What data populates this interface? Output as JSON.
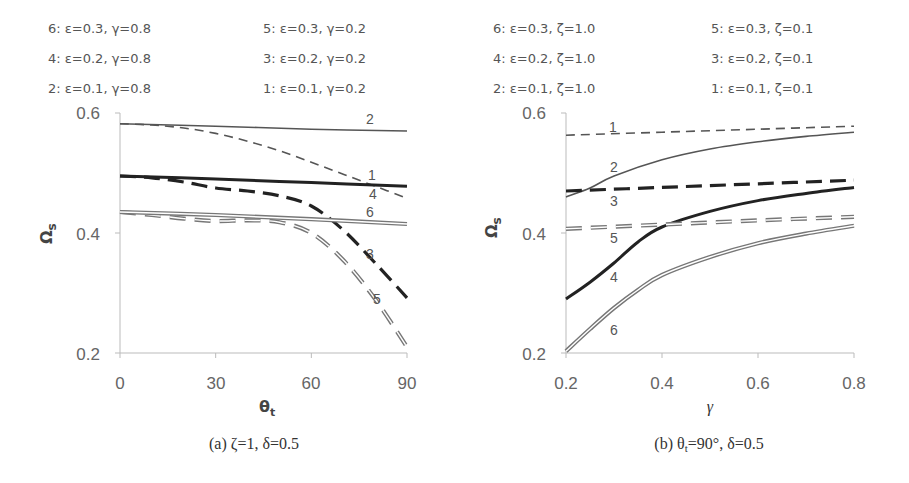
{
  "chart_data": [
    {
      "type": "line",
      "caption": "(a) ζ=1, δ=0.5",
      "xlabel": "θt",
      "ylabel": "Ωs",
      "xlim": [
        0,
        90
      ],
      "ylim": [
        0.2,
        0.6
      ],
      "xticks": [
        "0",
        "30",
        "60",
        "90"
      ],
      "yticks": [
        "0.2",
        "0.4",
        "0.6"
      ],
      "legend": [
        "6: ε=0.3, γ=0.8",
        "5: ε=0.3, γ=0.2",
        "4: ε=0.2, γ=0.8",
        "3: ε=0.2, γ=0.2",
        "2: ε=0.1, γ=0.8",
        "1: ε=0.1, γ=0.2"
      ],
      "series": [
        {
          "name": "1",
          "style": "thin-dash",
          "x": [
            0,
            10,
            20,
            30,
            40,
            50,
            60,
            70,
            80,
            90
          ],
          "y": [
            0.582,
            0.58,
            0.575,
            0.566,
            0.553,
            0.537,
            0.518,
            0.498,
            0.478,
            0.458
          ]
        },
        {
          "name": "2",
          "style": "thin-solid",
          "x": [
            0,
            30,
            60,
            90
          ],
          "y": [
            0.582,
            0.578,
            0.573,
            0.57
          ]
        },
        {
          "name": "3",
          "style": "thick-dash",
          "x": [
            0,
            10,
            20,
            30,
            40,
            50,
            60,
            70,
            80,
            90
          ],
          "y": [
            0.495,
            0.492,
            0.485,
            0.475,
            0.47,
            0.462,
            0.445,
            0.405,
            0.35,
            0.292
          ]
        },
        {
          "name": "4",
          "style": "thick-solid",
          "x": [
            0,
            30,
            60,
            90
          ],
          "y": [
            0.495,
            0.49,
            0.484,
            0.478
          ]
        },
        {
          "name": "5",
          "style": "double-dash",
          "x": [
            0,
            10,
            20,
            30,
            40,
            50,
            60,
            70,
            80,
            90
          ],
          "y": [
            0.435,
            0.43,
            0.424,
            0.42,
            0.421,
            0.418,
            0.4,
            0.355,
            0.29,
            0.21
          ]
        },
        {
          "name": "6",
          "style": "double-solid",
          "x": [
            0,
            30,
            60,
            90
          ],
          "y": [
            0.435,
            0.43,
            0.423,
            0.415
          ]
        }
      ]
    },
    {
      "type": "line",
      "caption": "(b) θt=90°, δ=0.5",
      "xlabel": "γ",
      "ylabel": "Ωs",
      "xlim": [
        0.2,
        0.8
      ],
      "ylim": [
        0.2,
        0.6
      ],
      "xticks": [
        "0.2",
        "0.4",
        "0.6",
        "0.8"
      ],
      "yticks": [
        "0.2",
        "0.4",
        "0.6"
      ],
      "legend": [
        "6: ε=0.3, ζ=1.0",
        "5: ε=0.3, ζ=0.1",
        "4: ε=0.2, ζ=1.0",
        "3: ε=0.2, ζ=0.1",
        "2: ε=0.1, ζ=1.0",
        "1: ε=0.1, ζ=0.1"
      ],
      "series": [
        {
          "name": "1",
          "style": "thin-dash",
          "x": [
            0.2,
            0.4,
            0.6,
            0.8
          ],
          "y": [
            0.563,
            0.568,
            0.573,
            0.578
          ]
        },
        {
          "name": "2",
          "style": "thin-solid",
          "x": [
            0.2,
            0.25,
            0.3,
            0.4,
            0.5,
            0.6,
            0.7,
            0.8
          ],
          "y": [
            0.46,
            0.475,
            0.495,
            0.522,
            0.54,
            0.552,
            0.561,
            0.568
          ]
        },
        {
          "name": "3",
          "style": "thick-dash",
          "x": [
            0.2,
            0.4,
            0.6,
            0.8
          ],
          "y": [
            0.47,
            0.476,
            0.482,
            0.488
          ]
        },
        {
          "name": "4",
          "style": "thick-solid",
          "x": [
            0.2,
            0.25,
            0.3,
            0.35,
            0.4,
            0.5,
            0.6,
            0.7,
            0.8
          ],
          "y": [
            0.29,
            0.318,
            0.35,
            0.385,
            0.41,
            0.436,
            0.454,
            0.466,
            0.476
          ]
        },
        {
          "name": "5",
          "style": "double-dash",
          "x": [
            0.2,
            0.4,
            0.6,
            0.8
          ],
          "y": [
            0.407,
            0.414,
            0.421,
            0.427
          ]
        },
        {
          "name": "6",
          "style": "double-solid",
          "x": [
            0.2,
            0.25,
            0.3,
            0.35,
            0.4,
            0.5,
            0.6,
            0.7,
            0.8
          ],
          "y": [
            0.203,
            0.24,
            0.275,
            0.305,
            0.33,
            0.36,
            0.383,
            0.399,
            0.412
          ]
        }
      ]
    }
  ]
}
